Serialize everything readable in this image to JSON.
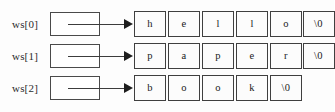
{
  "diagram": {
    "type": "pointer-to-character-array",
    "colors": {
      "background": "#fdfdfd",
      "cell_border": "#3f3f3f",
      "box_border": "#4a4a4a",
      "arrow": "#3c3c3c",
      "text": "#1a1a1a"
    },
    "rows": [
      {
        "label": "ws[0]",
        "pointer_box": "",
        "arrow": "arrow-right",
        "string": "hello",
        "cells": [
          "h",
          "e",
          "l",
          "l",
          "o",
          "\\0"
        ]
      },
      {
        "label": "ws[1]",
        "pointer_box": "",
        "arrow": "arrow-right",
        "string": "paper",
        "cells": [
          "p",
          "a",
          "p",
          "e",
          "r",
          "\\0"
        ]
      },
      {
        "label": "ws[2]",
        "pointer_box": "",
        "arrow": "arrow-right",
        "string": "book",
        "cells": [
          "b",
          "o",
          "o",
          "k",
          "\\0"
        ]
      }
    ]
  }
}
